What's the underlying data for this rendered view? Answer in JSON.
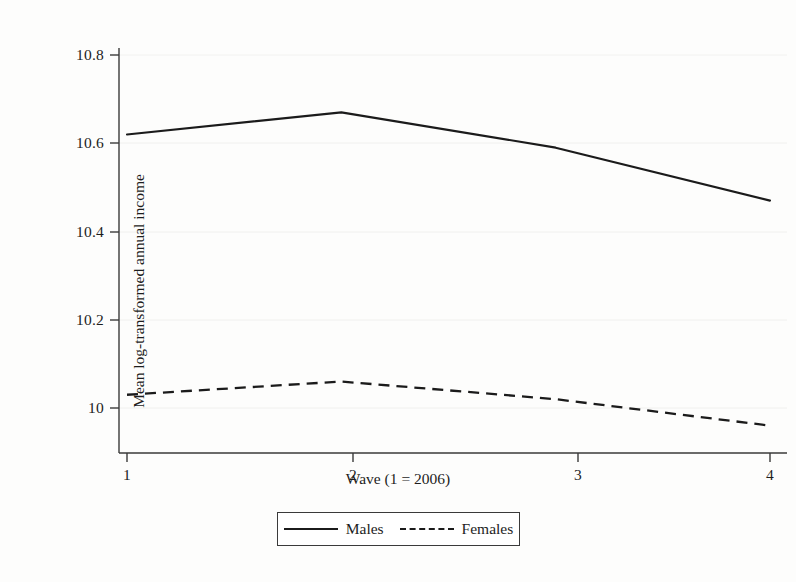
{
  "chart_data": {
    "type": "line",
    "title": "",
    "xlabel": "Wave (1 = 2006)",
    "ylabel": "Mean log-transformed annual income",
    "x": [
      1,
      2,
      3,
      4
    ],
    "xtick_labels": [
      "1",
      "2",
      "3",
      "4"
    ],
    "ytick_labels": [
      "10.8",
      "10.6",
      "10.4",
      "10.2",
      "10"
    ],
    "ytick_values": [
      10.8,
      10.6,
      10.4,
      10.2,
      10.0
    ],
    "xlim": [
      0.85,
      4.25
    ],
    "ylim": [
      9.9,
      10.87
    ],
    "grid": "horizontal-faint",
    "legend_position": "below-axes",
    "series": [
      {
        "name": "Males",
        "style": "solid",
        "color": "#1b1b1b",
        "values": [
          10.62,
          10.67,
          10.59,
          10.47
        ]
      },
      {
        "name": "Females",
        "style": "dashed",
        "color": "#1b1b1b",
        "values": [
          10.03,
          10.06,
          10.02,
          9.96
        ]
      }
    ]
  },
  "legend": {
    "entries": [
      {
        "label": "Males",
        "style": "solid"
      },
      {
        "label": "Females",
        "style": "dashed"
      }
    ]
  },
  "axes": {
    "y_title": "Mean log-transformed annual income",
    "x_title": "Wave (1 = 2006)",
    "y_ticks": [
      "10.8",
      "10.6",
      "10.4",
      "10.2",
      "10"
    ],
    "x_ticks": [
      "1",
      "2",
      "3",
      "4"
    ]
  },
  "colors": {
    "line": "#1b1b1b",
    "axis": "#3a3a3a",
    "grid": "#f0f0ee",
    "background": "#fdfdfc",
    "text": "#1d1d1d"
  }
}
